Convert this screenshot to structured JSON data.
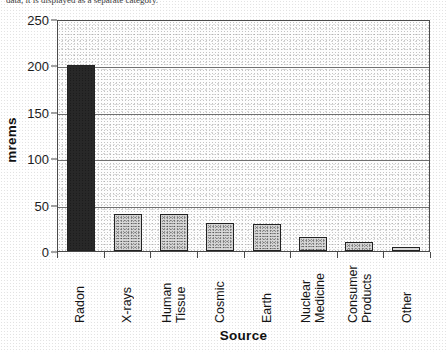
{
  "top_fragment": "data, it is displayed as a separate category.",
  "chart_data": {
    "type": "bar",
    "title": "",
    "xlabel": "Source",
    "ylabel": "mrems",
    "categories": [
      "Radon",
      "X-rays",
      "Human Tissue",
      "Cosmic",
      "Earth",
      "Nuclear Medicine",
      "Consumer Products",
      "Other"
    ],
    "category_lines": [
      [
        "Radon"
      ],
      [
        "X-rays"
      ],
      [
        "Human",
        "Tissue"
      ],
      [
        "Cosmic"
      ],
      [
        "Earth"
      ],
      [
        "Nuclear",
        "Medicine"
      ],
      [
        "Consumer",
        "Products"
      ],
      [
        "Other"
      ]
    ],
    "values": [
      200,
      40,
      40,
      30,
      29,
      15,
      10,
      4
    ],
    "ylim": [
      0,
      250
    ],
    "yticks": [
      0,
      50,
      100,
      150,
      200,
      250
    ],
    "ytick_labels": [
      "0",
      "50",
      "100",
      "150",
      "200",
      "250"
    ],
    "grid": true,
    "legend": false,
    "bar_colors": {
      "default": "#d8d8d8",
      "highlight": "#9a9a9a",
      "border": "#222222"
    },
    "axis_color": "#4a4a4a",
    "gridline_color": "#6f6f6f"
  }
}
